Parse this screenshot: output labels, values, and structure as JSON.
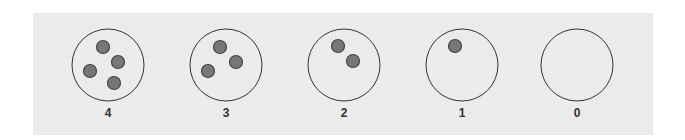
{
  "diagram": {
    "colors": {
      "panel": "#ebebeb",
      "circle_stroke": "#333333",
      "dot_fill": "#777777",
      "dot_stroke": "#444444"
    },
    "groups": [
      {
        "label": "4",
        "cx": 108,
        "dots": [
          [
            -5,
            -18
          ],
          [
            10,
            -3
          ],
          [
            -18,
            6
          ],
          [
            6,
            18
          ]
        ]
      },
      {
        "label": "3",
        "cx": 226,
        "dots": [
          [
            -6,
            -18
          ],
          [
            10,
            -3
          ],
          [
            -18,
            6
          ]
        ]
      },
      {
        "label": "2",
        "cx": 344,
        "dots": [
          [
            -6,
            -19
          ],
          [
            9,
            -4
          ]
        ]
      },
      {
        "label": "1",
        "cx": 462,
        "dots": [
          [
            -7,
            -19
          ]
        ]
      },
      {
        "label": "0",
        "cx": 577,
        "dots": []
      }
    ]
  }
}
